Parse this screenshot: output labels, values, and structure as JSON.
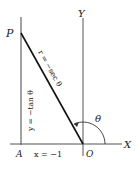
{
  "diagram": {
    "labels": {
      "P": "P",
      "Y": "Y",
      "X": "X",
      "A": "A",
      "O": "O",
      "theta": "θ"
    },
    "annotations": {
      "r_eq": "r = −sec θ",
      "y_eq": "y = −tan θ",
      "x_eq": "x = −1"
    },
    "colors": {
      "stroke": "#222222",
      "axis": "#555555",
      "background": "#ffffff"
    }
  }
}
